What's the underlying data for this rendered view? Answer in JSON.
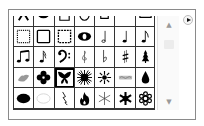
{
  "panel": {
    "title": "Custom Shape Picker",
    "menu_button_icon": "flyout-menu-icon",
    "selected_index": 23,
    "scrollbar": {
      "up_glyph": "▲",
      "down_glyph": "▼"
    }
  },
  "shapes": [
    {
      "name": "chevron-up-shape"
    },
    {
      "name": "half-circle-shape"
    },
    {
      "name": "square-frame-shape"
    },
    {
      "name": "u-frame-shape"
    },
    {
      "name": "box-frame-shape"
    },
    {
      "name": "arc-frame-shape"
    },
    {
      "name": "banner-frame-shape"
    },
    {
      "name": "stamp-frame-shape"
    },
    {
      "name": "rough-frame-shape"
    },
    {
      "name": "dotted-frame-shape"
    },
    {
      "name": "eye-ring-shape"
    },
    {
      "name": "half-note-shape"
    },
    {
      "name": "quarter-note-shape"
    },
    {
      "name": "eighth-note-shape"
    },
    {
      "name": "beamed-eighth-notes-shape"
    },
    {
      "name": "sixteenth-note-shape"
    },
    {
      "name": "bass-clef-shape"
    },
    {
      "name": "treble-clef-shape"
    },
    {
      "name": "flat-sign-shape"
    },
    {
      "name": "sharp-sign-shape"
    },
    {
      "name": "tree-shape"
    },
    {
      "name": "grass-shape"
    },
    {
      "name": "flower-shape"
    },
    {
      "name": "butterfly-shape"
    },
    {
      "name": "sunburst-shape"
    },
    {
      "name": "sun-shape"
    },
    {
      "name": "ornament-shape"
    },
    {
      "name": "raindrop-shape"
    },
    {
      "name": "cloud-filled-shape"
    },
    {
      "name": "cloud-outline-shape"
    },
    {
      "name": "lightning-shape"
    },
    {
      "name": "fire-shape"
    },
    {
      "name": "snowflake-thin-shape"
    },
    {
      "name": "snowflake-bold-shape"
    },
    {
      "name": "snowflake-ornate-shape"
    }
  ]
}
